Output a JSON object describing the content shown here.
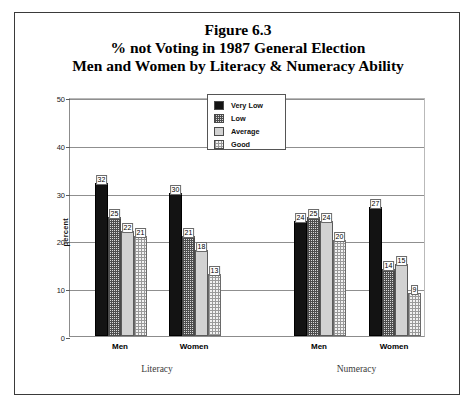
{
  "figure": {
    "title_line1": "Figure 6.3",
    "title_line2": "% not Voting in 1987 General Election",
    "title_line3": "Men and Women by Literacy & Numeracy Ability"
  },
  "legend": {
    "items": [
      {
        "label": "Very Low",
        "swatch": "solid-black"
      },
      {
        "label": "Low",
        "swatch": "dense-checker"
      },
      {
        "label": "Average",
        "swatch": "solid-light-gray"
      },
      {
        "label": "Good",
        "swatch": "sparse-checker"
      }
    ]
  },
  "axes": {
    "ylabel": "percent",
    "yticks": [
      "0",
      "10",
      "20",
      "30",
      "40",
      "50"
    ],
    "group_labels": [
      "Literacy",
      "Numeracy"
    ],
    "category_labels": [
      "Men",
      "Women",
      "Men",
      "Women"
    ]
  },
  "chart_data": {
    "type": "bar",
    "xlabel": "",
    "ylabel": "percent",
    "ylim": [
      0,
      50
    ],
    "ytick_step": 10,
    "grid": true,
    "legend_position": "top-center",
    "categories": [
      "Literacy / Men",
      "Literacy / Women",
      "Numeracy / Men",
      "Numeracy / Women"
    ],
    "groups": [
      "Literacy",
      "Numeracy"
    ],
    "subcategories": [
      "Men",
      "Women"
    ],
    "series": [
      {
        "name": "Very Low",
        "values": [
          32,
          30,
          24,
          27
        ]
      },
      {
        "name": "Low",
        "values": [
          25,
          21,
          25,
          14
        ]
      },
      {
        "name": "Average",
        "values": [
          22,
          18,
          24,
          15
        ]
      },
      {
        "name": "Good",
        "values": [
          21,
          13,
          20,
          9
        ]
      }
    ]
  }
}
